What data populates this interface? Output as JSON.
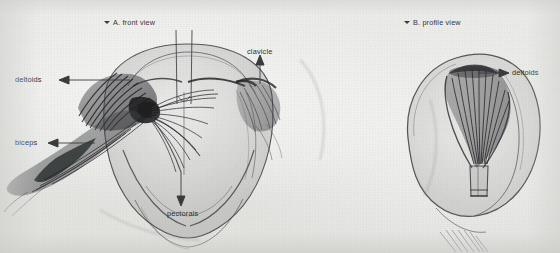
{
  "figure": {
    "medium": "pencil anatomical study on paper",
    "paper_color": "#e7e7e4",
    "ink_color": "#3a3b3d",
    "annotation_color": "#2f3032"
  },
  "views": [
    {
      "id": "a",
      "marker": "triangle-down",
      "caption": "A. front view"
    },
    {
      "id": "b",
      "marker": "triangle-down",
      "caption": "B. profile view"
    }
  ],
  "labels": [
    {
      "id": "deltoids-left",
      "text": "deltoids",
      "arrow": "left",
      "view": "a"
    },
    {
      "id": "biceps",
      "text": "biceps",
      "arrow": "left",
      "view": "a"
    },
    {
      "id": "clavicle",
      "text": "clavicle",
      "arrow": "up",
      "view": "a"
    },
    {
      "id": "pectorals",
      "text": "pectorals",
      "arrow": "down",
      "view": "a"
    },
    {
      "id": "deltoids-right",
      "text": "deltoids",
      "arrow": "right",
      "view": "b"
    }
  ]
}
